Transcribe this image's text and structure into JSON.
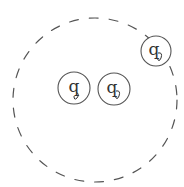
{
  "diagram": {
    "type": "set-diagram",
    "stroke_color": "#555555",
    "boundary": {
      "shape": "dashed-circle",
      "cx": 95,
      "cy": 100,
      "r": 82
    },
    "nodes": [
      {
        "id": "node-1",
        "label": "q",
        "cx": 74,
        "cy": 88,
        "r": 16,
        "position": "inside"
      },
      {
        "id": "node-2",
        "label": "q",
        "cx": 114,
        "cy": 89,
        "r": 16,
        "position": "inside"
      },
      {
        "id": "node-3",
        "label": "q",
        "cx": 156,
        "cy": 51,
        "r": 15,
        "position": "on-boundary"
      }
    ]
  }
}
